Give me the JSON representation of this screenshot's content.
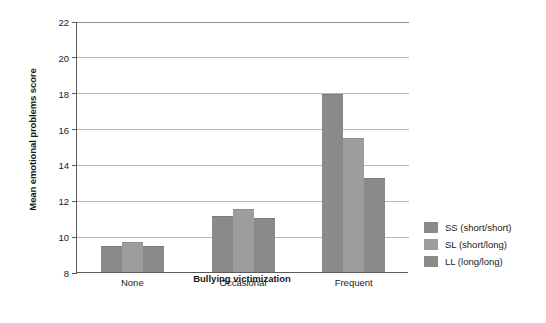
{
  "chart_data": {
    "type": "bar",
    "title": "",
    "xlabel": "Bullying victimization",
    "ylabel": "Mean emotional problems score",
    "categories": [
      "None",
      "Occasional",
      "Frequent"
    ],
    "series": [
      {
        "name": "SS (short/short)",
        "values": [
          9.45,
          11.15,
          17.95
        ],
        "color": "#8a8a8a"
      },
      {
        "name": "SL (short/long)",
        "values": [
          9.65,
          11.5,
          15.45
        ],
        "color": "#9d9d9d"
      },
      {
        "name": "LL (long/long)",
        "values": [
          9.45,
          11.0,
          13.25
        ],
        "color": "#8a8a8a"
      }
    ],
    "ylim": [
      8,
      22
    ],
    "ytick_step": 2,
    "yticks": [
      22,
      20,
      18,
      16,
      14,
      12,
      10,
      8
    ],
    "ytick_labels": [
      "22",
      "20",
      "18",
      "16",
      "14",
      "12",
      "10",
      "8"
    ],
    "grid": true,
    "grid_axis": "y",
    "legend_position": "right",
    "legend": [
      {
        "label": "SS (short/short)",
        "color": "#8a8a8a"
      },
      {
        "label": "SL (short/long)",
        "color": "#9d9d9d"
      },
      {
        "label": "LL (long/long)",
        "color": "#8a8a8a"
      }
    ],
    "background": "#ffffff",
    "axis_color": "#5a5a5a",
    "grid_color": "#b6b6b6"
  }
}
